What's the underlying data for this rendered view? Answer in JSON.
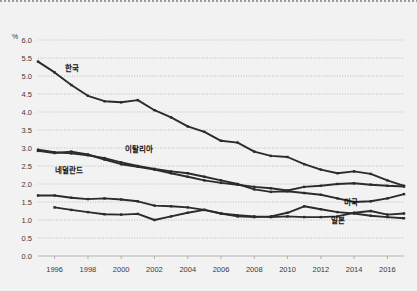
{
  "chart_root": {
    "name": "oecd-rnd-line-chart"
  },
  "axis": {
    "unit_label": "%",
    "y_ticks": [
      "0.0",
      "0.5",
      "1.0",
      "1.5",
      "2.0",
      "2.5",
      "3.0",
      "3.5",
      "4.0",
      "4.5",
      "5.0",
      "5.5",
      "6.0"
    ],
    "x_ticks": [
      "1996",
      "1998",
      "2000",
      "2002",
      "2004",
      "2006",
      "2008",
      "2010",
      "2012",
      "2014",
      "2016"
    ]
  },
  "chart_data": {
    "type": "line",
    "title": "",
    "xlabel": "",
    "ylabel": "%",
    "ylim": [
      0.0,
      6.0
    ],
    "xlim": [
      1995,
      2017
    ],
    "grid": true,
    "legend": "inline-annotations",
    "x": [
      1995,
      1996,
      1997,
      1998,
      1999,
      2000,
      2001,
      2002,
      2003,
      2004,
      2005,
      2006,
      2007,
      2008,
      2009,
      2010,
      2011,
      2012,
      2013,
      2014,
      2015,
      2016,
      2017
    ],
    "series": [
      {
        "name": "한국",
        "label_en": "Korea",
        "color": "#2b2b2b",
        "label_x": 1996.6,
        "label_y": 5.15,
        "values": [
          5.4,
          5.1,
          4.75,
          4.45,
          4.3,
          4.27,
          4.33,
          4.05,
          3.85,
          3.6,
          3.45,
          3.2,
          3.15,
          2.9,
          2.78,
          2.75,
          2.55,
          2.4,
          2.3,
          2.35,
          2.28,
          2.1,
          1.95
        ]
      },
      {
        "name": "이탈리아",
        "label_en": "Italy",
        "color": "#2b2b2b",
        "label_x": 2000.2,
        "label_y": 2.88,
        "values": [
          2.95,
          2.88,
          2.85,
          2.8,
          2.72,
          2.6,
          2.5,
          2.42,
          2.35,
          2.3,
          2.2,
          2.1,
          2.0,
          1.85,
          1.78,
          1.8,
          1.75,
          1.7,
          1.6,
          1.5,
          1.52,
          1.6,
          1.72
        ]
      },
      {
        "name": "네덜란드",
        "label_en": "Netherlands",
        "color": "#2b2b2b",
        "label_x": 1996.0,
        "label_y": 2.3,
        "values": [
          2.92,
          2.86,
          2.9,
          2.82,
          2.68,
          2.55,
          2.48,
          2.4,
          2.3,
          2.2,
          2.1,
          2.03,
          1.98,
          1.92,
          1.88,
          1.82,
          1.92,
          1.95,
          2.0,
          2.02,
          1.98,
          1.95,
          1.93
        ]
      },
      {
        "name": "미국",
        "label_en": "United States",
        "color": "#2b2b2b",
        "label_x": 2013.4,
        "label_y": 1.42,
        "values": [
          1.68,
          1.68,
          1.62,
          1.58,
          1.6,
          1.57,
          1.52,
          1.4,
          1.38,
          1.35,
          1.28,
          1.18,
          1.13,
          1.1,
          1.08,
          1.1,
          1.08,
          1.08,
          1.1,
          1.2,
          1.25,
          1.15,
          1.18
        ]
      },
      {
        "name": "일본",
        "label_en": "Japan",
        "color": "#2b2b2b",
        "label_x": 2012.6,
        "label_y": 0.93,
        "values": [
          null,
          1.35,
          1.28,
          1.22,
          1.16,
          1.15,
          1.17,
          1.0,
          1.1,
          1.2,
          1.28,
          1.18,
          1.1,
          1.08,
          1.1,
          1.2,
          1.38,
          1.3,
          1.22,
          1.18,
          1.12,
          1.08,
          1.05
        ]
      }
    ]
  }
}
